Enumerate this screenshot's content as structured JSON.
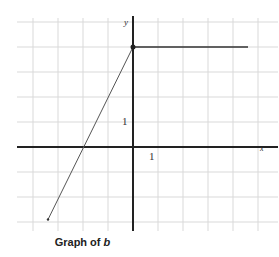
{
  "chart_data": {
    "type": "line",
    "title": "Graph of b",
    "title_prefix": "Graph of",
    "title_var": "b",
    "xlabel": "x",
    "ylabel": "y",
    "tick_labels": {
      "x": "1",
      "y": "1"
    },
    "xlim": [
      -5,
      5
    ],
    "ylim": [
      -3.4,
      4.5
    ],
    "grid": true,
    "series": [
      {
        "name": "segment",
        "points": [
          [
            -3.4,
            -2.9
          ],
          [
            0,
            4
          ]
        ],
        "endpoints": "none"
      },
      {
        "name": "horizontal",
        "points": [
          [
            0,
            4
          ],
          [
            4.6,
            4
          ]
        ],
        "start_marker": "closed-dot"
      }
    ],
    "colors": {
      "grid": "#d9d9d9",
      "axis": "#222222",
      "line": "#555555"
    }
  }
}
